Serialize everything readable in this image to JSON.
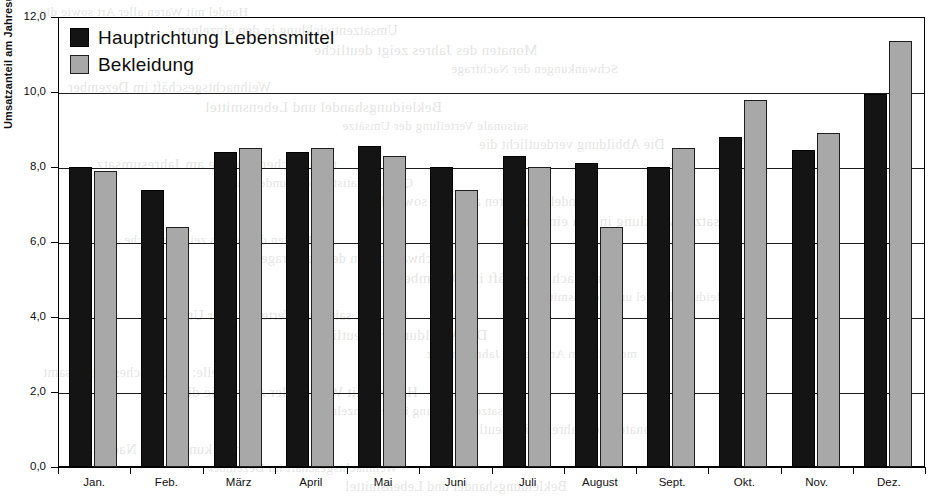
{
  "chart_data": {
    "type": "bar",
    "title": "",
    "subtitle": "",
    "xlabel": "",
    "ylabel": "Umsatzanteil am Jahresumsatz (in %)",
    "categories": [
      "Jan.",
      "Feb.",
      "März",
      "April",
      "Mai",
      "Juni",
      "Juli",
      "August",
      "Sept.",
      "Okt.",
      "Nov.",
      "Dez."
    ],
    "series": [
      {
        "name": "Hauptrichtung Lebensmittel",
        "color": "#141414",
        "values": [
          8.0,
          7.4,
          8.4,
          8.4,
          8.55,
          8.0,
          8.3,
          8.1,
          8.0,
          8.8,
          8.45,
          9.95
        ]
      },
      {
        "name": "Bekleidung",
        "color": "#a8a8a8",
        "values": [
          7.9,
          6.4,
          8.5,
          8.5,
          8.3,
          7.4,
          8.0,
          6.4,
          8.5,
          9.8,
          8.9,
          11.35
        ]
      }
    ],
    "ylim": [
      0.0,
      12.0
    ],
    "yticks": [
      0.0,
      2.0,
      4.0,
      6.0,
      8.0,
      10.0,
      12.0
    ],
    "ytick_labels": [
      "0,0",
      "2,0",
      "4,0",
      "6,0",
      "8,0",
      "10,0",
      "12,0"
    ],
    "grid": true,
    "grid_axis": "y",
    "legend_position": "upper-left-inside",
    "decimal_separator": ","
  },
  "legend": {
    "entries": [
      {
        "label": "Hauptrichtung Lebensmittel",
        "swatch": "dark-square-swatch"
      },
      {
        "label": "Bekleidung",
        "swatch": "gray-square-swatch"
      }
    ]
  },
  "scan_artifacts": {
    "bleed_lines": [
      "Handel mit Waren aller Art sowie die",
      "Umsatzentwicklung in den einzelnen",
      "Monaten des Jahres zeigt deutliche",
      "Schwankungen der Nachfrage",
      "Weihnachtsgeschäft im Dezember",
      "Bekleidungshandel und Lebensmittel",
      "saisonale Verteilung der Umsätze",
      "Die Abbildung verdeutlicht die",
      "monatlichen Anteile am Jahresumsatz",
      "Quelle: Statistisches Bundesamt"
    ]
  }
}
